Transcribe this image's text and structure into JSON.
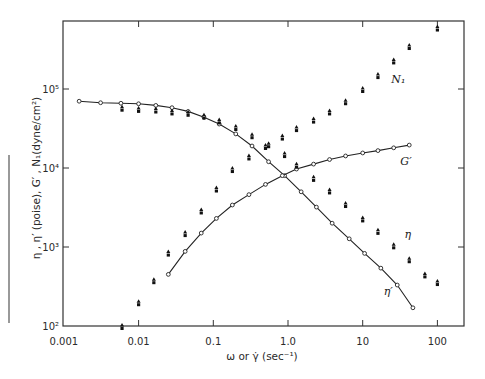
{
  "chart_data": {
    "type": "scatter",
    "title": "",
    "xlabel": "ω or γ̇ (sec⁻¹)",
    "ylabel": "η , η′ (poise), G′ , N₁(dyne/cm²)",
    "xscale": "log",
    "yscale": "log",
    "xlim": [
      0.001,
      150
    ],
    "ylim": [
      100,
      800000
    ],
    "x_ticks": [
      0.001,
      0.01,
      0.1,
      1.0,
      10,
      100
    ],
    "x_tick_labels": [
      "0.001",
      "0.01",
      "0.1",
      "1.0",
      "10",
      "100"
    ],
    "y_ticks": [
      100,
      1000,
      10000,
      100000
    ],
    "y_tick_labels": [
      "10²",
      "10³",
      "10⁴",
      "10⁵"
    ],
    "grid": false,
    "legend": "none (series labelled directly on curves)",
    "series": [
      {
        "name": "η′",
        "label": "η′",
        "marker": "open-circle",
        "line": true,
        "points": [
          [
            0.0016,
            70000
          ],
          [
            0.0031,
            67000
          ],
          [
            0.0058,
            66000
          ],
          [
            0.01,
            65000
          ],
          [
            0.017,
            62000
          ],
          [
            0.028,
            58000
          ],
          [
            0.046,
            52000
          ],
          [
            0.075,
            44000
          ],
          [
            0.12,
            36000
          ],
          [
            0.2,
            27000
          ],
          [
            0.33,
            19000
          ],
          [
            0.55,
            12000
          ],
          [
            0.9,
            8000
          ],
          [
            1.5,
            5000
          ],
          [
            2.4,
            3200
          ],
          [
            3.9,
            2000
          ],
          [
            6.6,
            1270
          ],
          [
            10.6,
            830
          ],
          [
            17.5,
            540
          ],
          [
            29,
            330
          ],
          [
            47,
            170
          ]
        ]
      },
      {
        "name": "G′",
        "label": "G′",
        "marker": "open-circle",
        "line": true,
        "points": [
          [
            0.025,
            450
          ],
          [
            0.042,
            880
          ],
          [
            0.069,
            1500
          ],
          [
            0.11,
            2300
          ],
          [
            0.18,
            3400
          ],
          [
            0.3,
            4600
          ],
          [
            0.5,
            6200
          ],
          [
            0.84,
            8000
          ],
          [
            1.3,
            9700
          ],
          [
            2.2,
            11200
          ],
          [
            3.6,
            12800
          ],
          [
            5.9,
            14200
          ],
          [
            10,
            15500
          ],
          [
            16,
            16600
          ],
          [
            26,
            18000
          ],
          [
            42,
            19500
          ]
        ]
      },
      {
        "name": "η",
        "label": "η",
        "marker": "filled-triangle-and-square",
        "line": false,
        "points": [
          [
            0.006,
            58000
          ],
          [
            0.01,
            56000
          ],
          [
            0.017,
            55000
          ],
          [
            0.028,
            52000
          ],
          [
            0.046,
            50000
          ],
          [
            0.075,
            46000
          ],
          [
            0.12,
            40000
          ],
          [
            0.2,
            33000
          ],
          [
            0.33,
            26000
          ],
          [
            0.55,
            20000
          ],
          [
            0.9,
            15000
          ],
          [
            1.3,
            11000
          ],
          [
            2.2,
            7500
          ],
          [
            3.6,
            5200
          ],
          [
            5.9,
            3500
          ],
          [
            10,
            2300
          ],
          [
            16,
            1600
          ],
          [
            26,
            1050
          ],
          [
            42,
            700
          ],
          [
            68,
            450
          ],
          [
            100,
            360
          ]
        ]
      },
      {
        "name": "N₁",
        "label": "N₁",
        "marker": "filled-triangle-and-square",
        "line": false,
        "points": [
          [
            0.006,
            100
          ],
          [
            0.01,
            200
          ],
          [
            0.016,
            380
          ],
          [
            0.025,
            850
          ],
          [
            0.042,
            1500
          ],
          [
            0.069,
            2900
          ],
          [
            0.11,
            5500
          ],
          [
            0.18,
            9700
          ],
          [
            0.3,
            14000
          ],
          [
            0.5,
            19000
          ],
          [
            0.84,
            25000
          ],
          [
            1.3,
            32000
          ],
          [
            2.2,
            41000
          ],
          [
            3.6,
            52000
          ],
          [
            5.9,
            70000
          ],
          [
            10,
            100000
          ],
          [
            16,
            150000
          ],
          [
            26,
            230000
          ],
          [
            42,
            350000
          ],
          [
            100,
            600000
          ]
        ]
      }
    ],
    "annotations": [
      {
        "text": "N₁",
        "near": [
          30,
          120000
        ]
      },
      {
        "text": "G′",
        "near": [
          38,
          11000
        ]
      },
      {
        "text": "η",
        "near": [
          40,
          1300
        ]
      },
      {
        "text": "η′",
        "near": [
          22,
          250
        ]
      }
    ]
  }
}
